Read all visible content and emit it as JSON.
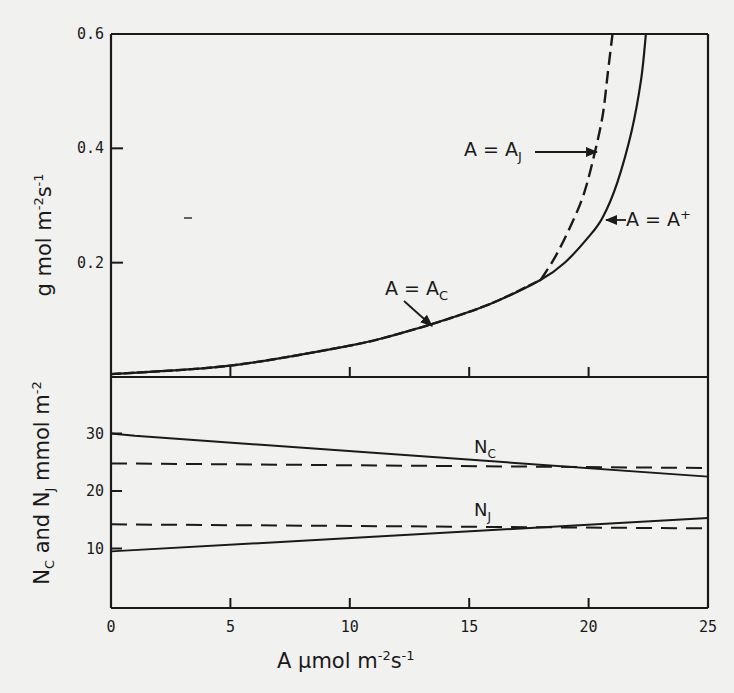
{
  "figure": {
    "background": "#f1f1ef",
    "ink": "#1a1a1a"
  },
  "chart_data": [
    {
      "panel": "upper",
      "type": "line",
      "xlabel": "A  µmol m-2 s-1",
      "ylabel": "g  mol m-2 s-1",
      "xlim": [
        0,
        25
      ],
      "ylim": [
        0,
        0.6
      ],
      "yticks": [
        "0.2",
        "0.4",
        "0.6"
      ],
      "grid": false,
      "series": [
        {
          "name": "A = A+",
          "style": "solid",
          "x": [
            0,
            5,
            10,
            12,
            14,
            16,
            18,
            19,
            20,
            20.6,
            21.2,
            21.8,
            22.2,
            22.4
          ],
          "y": [
            0.005,
            0.02,
            0.055,
            0.075,
            0.1,
            0.13,
            0.17,
            0.2,
            0.245,
            0.28,
            0.34,
            0.43,
            0.52,
            0.6
          ]
        },
        {
          "name": "A = AJ",
          "style": "dashed",
          "x": [
            18,
            18.6,
            19.2,
            19.8,
            20.3,
            20.6,
            20.8,
            21.0
          ],
          "y": [
            0.17,
            0.21,
            0.26,
            0.32,
            0.4,
            0.46,
            0.53,
            0.6
          ]
        },
        {
          "name": "A = AC",
          "style": "dashed",
          "x": [
            0,
            5,
            10,
            12,
            14,
            16,
            18
          ],
          "y": [
            0.005,
            0.02,
            0.055,
            0.075,
            0.1,
            0.13,
            0.17
          ]
        }
      ],
      "annotations": [
        {
          "text": "A = AJ",
          "arrow_to": [
            20.5,
            0.4
          ]
        },
        {
          "text": "A = A+",
          "arrow_to": [
            21.3,
            0.28
          ]
        },
        {
          "text": "A = AC",
          "arrow_to": [
            12.2,
            0.085
          ]
        }
      ]
    },
    {
      "panel": "lower",
      "type": "line",
      "xlabel": "A  µmol m-2 s-1",
      "ylabel": "NC and NJ mmol m-2",
      "xlim": [
        0,
        25
      ],
      "ylim": [
        0,
        35
      ],
      "xticks": [
        "0",
        "5",
        "10",
        "15",
        "20",
        "25"
      ],
      "yticks": [
        "10",
        "20",
        "30"
      ],
      "grid": false,
      "series": [
        {
          "name": "NC",
          "style": "solid",
          "x": [
            0,
            1,
            25
          ],
          "y": [
            30,
            29.6,
            22.5
          ]
        },
        {
          "name": "NC (reference)",
          "style": "dashed",
          "x": [
            0,
            25
          ],
          "y": [
            24.8,
            24.0
          ]
        },
        {
          "name": "NJ",
          "style": "solid",
          "x": [
            0,
            25
          ],
          "y": [
            9.5,
            15.3
          ]
        },
        {
          "name": "NJ (reference)",
          "style": "dashed",
          "x": [
            0,
            25
          ],
          "y": [
            14.2,
            13.5
          ]
        }
      ],
      "annotations": [
        {
          "text": "NC",
          "at": [
            16.5,
            26
          ]
        },
        {
          "text": "NJ",
          "at": [
            16.5,
            16
          ]
        }
      ]
    }
  ],
  "labels": {
    "upper_yticks": [
      {
        "text": "0.6",
        "value": 0.6
      },
      {
        "text": "0.4",
        "value": 0.4
      },
      {
        "text": "0.2",
        "value": 0.2
      }
    ],
    "lower_yticks": [
      {
        "text": "30",
        "value": 30
      },
      {
        "text": "20",
        "value": 20
      },
      {
        "text": "10",
        "value": 10
      }
    ],
    "xticks": [
      {
        "text": "0",
        "value": 0
      },
      {
        "text": "5",
        "value": 5
      },
      {
        "text": "10",
        "value": 10
      },
      {
        "text": "15",
        "value": 15
      },
      {
        "text": "20",
        "value": 20
      },
      {
        "text": "25",
        "value": 25
      }
    ],
    "x_axis_title": {
      "main": "A  µmol m",
      "exp1": "-2",
      "mid": "s",
      "exp2": "-1"
    },
    "upper_y_title": {
      "main": "g  mol m",
      "exp1": "-2",
      "mid": "s",
      "exp2": "-1"
    },
    "lower_y_title": {
      "n1": "N",
      "n1sub": "C",
      "and": " and N",
      "n2sub": "J",
      "unit": " mmol m",
      "exp": "-2"
    },
    "ann_aj": {
      "lhs": "A  =  A",
      "sub": "J"
    },
    "ann_aplus": {
      "lhs": "A  =  A",
      "sup": "+"
    },
    "ann_ac": {
      "lhs": "A  =  A",
      "sub": "C"
    },
    "ann_nc": {
      "main": "N",
      "sub": "C"
    },
    "ann_nj": {
      "main": "N",
      "sub": "J"
    }
  }
}
